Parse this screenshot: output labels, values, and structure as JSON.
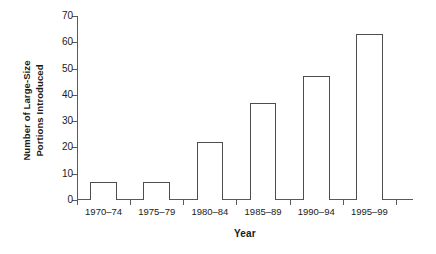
{
  "chart_data": {
    "type": "bar",
    "title": "",
    "subtitle": "",
    "xlabel": "Year",
    "ylabel": "Number of Large-Size Portions Introduced",
    "ylabel_lines": [
      "Number of Large-Size",
      "Portions Introduced"
    ],
    "categories": [
      "1970–74",
      "1975–79",
      "1980–84",
      "1985–89",
      "1990–94",
      "1995–99"
    ],
    "values": [
      7,
      7,
      22,
      37,
      47,
      63
    ],
    "ylim": [
      0,
      70
    ],
    "yticks": [
      0,
      10,
      20,
      30,
      40,
      50,
      60,
      70
    ],
    "ytick_labels": [
      "0",
      "10",
      "20",
      "30",
      "40",
      "50",
      "60",
      "70"
    ],
    "grid": false,
    "legend": false,
    "legend_position": "none",
    "bar_style": {
      "fill": "#ffffff",
      "edge": "#4d4d4d"
    },
    "axis_color": "#5a5a5a",
    "background": "#ffffff",
    "text_color": "#1a1a1a"
  }
}
